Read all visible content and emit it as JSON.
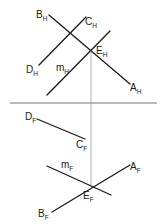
{
  "diagram": {
    "type": "orthographic-projection",
    "views": {
      "horizontal": {
        "labels": {
          "B": {
            "main": "B",
            "sub": "H"
          },
          "C": {
            "main": "C",
            "sub": "H"
          },
          "D": {
            "main": "D",
            "sub": "H"
          },
          "E": {
            "main": "E",
            "sub": "H"
          },
          "m": {
            "main": "m",
            "sub": "H"
          },
          "A": {
            "main": "A",
            "sub": "H"
          }
        }
      },
      "frontal": {
        "labels": {
          "D": {
            "main": "D",
            "sub": "F"
          },
          "C": {
            "main": "C",
            "sub": "F"
          },
          "m": {
            "main": "m",
            "sub": "F"
          },
          "A": {
            "main": "A",
            "sub": "F"
          },
          "E": {
            "main": "E",
            "sub": "F"
          },
          "B": {
            "main": "B",
            "sub": "F"
          }
        }
      }
    },
    "fold_line": "H/F",
    "colors": {
      "line": "#1a1a1a",
      "projector": "#8a8a8a",
      "fold": "#777777"
    }
  }
}
